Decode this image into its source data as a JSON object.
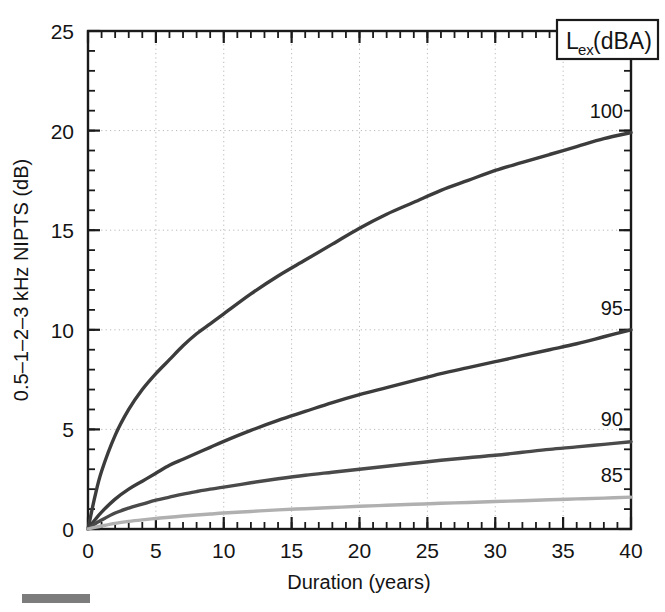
{
  "chart_data": {
    "type": "line",
    "title": "",
    "xlabel": "Duration (years)",
    "ylabel": "0.5–1–2–3 kHz NIPTS (dB)",
    "xlim": [
      0,
      40
    ],
    "ylim": [
      0,
      25
    ],
    "xticks": [
      0,
      5,
      10,
      15,
      20,
      25,
      30,
      35,
      40
    ],
    "yticks": [
      0,
      5,
      10,
      15,
      20,
      25
    ],
    "xtick_labels": [
      "0",
      "5",
      "10",
      "15",
      "20",
      "25",
      "30",
      "35",
      "40"
    ],
    "ytick_labels": [
      "0",
      "5",
      "10",
      "15",
      "20",
      "25"
    ],
    "x_minor_tick_step": 1,
    "y_minor_tick_step": 1,
    "grid": "dotted major gridlines, both axes",
    "legend_position": "top-right boxed title; series labelled at right end of each curve",
    "legend_title": "L_ex (dBA)",
    "legend_title_main": "L",
    "legend_title_sub": "ex",
    "legend_title_units": " (dBA)",
    "x": [
      0,
      0.5,
      1,
      2,
      3,
      4,
      5,
      6,
      7,
      8,
      9,
      10,
      12,
      14,
      16,
      18,
      20,
      22,
      24,
      26,
      28,
      30,
      32,
      34,
      36,
      38,
      40
    ],
    "series": [
      {
        "name": "100",
        "label": "100",
        "color": "#3c3c3c",
        "width": 3.4,
        "values": [
          0.0,
          1.6,
          2.9,
          4.7,
          6.0,
          7.0,
          7.8,
          8.5,
          9.2,
          9.8,
          10.3,
          10.8,
          11.8,
          12.7,
          13.5,
          14.3,
          15.1,
          15.8,
          16.4,
          17.0,
          17.5,
          18.0,
          18.4,
          18.8,
          19.2,
          19.6,
          19.9
        ]
      },
      {
        "name": "95",
        "label": "95",
        "color": "#3c3c3c",
        "width": 3.4,
        "values": [
          0.0,
          0.45,
          0.85,
          1.5,
          2.0,
          2.4,
          2.8,
          3.2,
          3.5,
          3.8,
          4.1,
          4.4,
          4.95,
          5.45,
          5.9,
          6.35,
          6.75,
          7.1,
          7.45,
          7.8,
          8.1,
          8.4,
          8.7,
          9.0,
          9.3,
          9.65,
          10.0
        ]
      },
      {
        "name": "90",
        "label": "90",
        "color": "#4a4a4a",
        "width": 3.4,
        "values": [
          0.0,
          0.25,
          0.45,
          0.8,
          1.05,
          1.25,
          1.45,
          1.6,
          1.75,
          1.88,
          2.0,
          2.1,
          2.32,
          2.52,
          2.7,
          2.85,
          3.0,
          3.15,
          3.3,
          3.45,
          3.58,
          3.7,
          3.85,
          4.0,
          4.12,
          4.25,
          4.38
        ]
      },
      {
        "name": "85",
        "label": "85",
        "color": "#b0b0b0",
        "width": 3.4,
        "values": [
          0.0,
          0.08,
          0.15,
          0.28,
          0.38,
          0.46,
          0.53,
          0.59,
          0.65,
          0.7,
          0.75,
          0.8,
          0.88,
          0.96,
          1.02,
          1.08,
          1.14,
          1.19,
          1.24,
          1.29,
          1.33,
          1.38,
          1.42,
          1.47,
          1.51,
          1.55,
          1.6
        ]
      }
    ],
    "series_label_positions": [
      {
        "name": "100",
        "x": 40,
        "y": 21.0
      },
      {
        "name": "95",
        "x": 40,
        "y": 11.1
      },
      {
        "name": "90",
        "x": 40,
        "y": 5.5
      },
      {
        "name": "85",
        "x": 40,
        "y": 2.7
      }
    ],
    "colors": {
      "axis": "#1a1a1a",
      "grid": "#b9b9b9",
      "background": "#ffffff",
      "scalebar": "#7c7c7c"
    }
  }
}
